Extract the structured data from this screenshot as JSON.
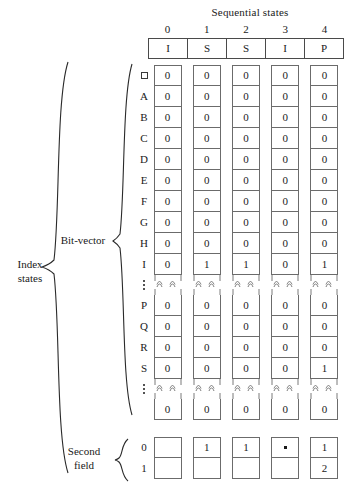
{
  "figure": {
    "header": {
      "title": "Sequential states",
      "column_numbers": [
        "0",
        "1",
        "2",
        "3",
        "4"
      ],
      "state_values": [
        "I",
        "S",
        "S",
        "I",
        "P"
      ]
    },
    "braces": {
      "index_states": "Index\nstates",
      "index_states_line1": "Index",
      "index_states_line2": "states",
      "bit_vector": "Bit-vector",
      "second_field_line1": "Second",
      "second_field_line2": "field"
    },
    "bit_vector": {
      "rows": [
        {
          "label": "blank-square",
          "label_kind": "glyph",
          "values": [
            "0",
            "0",
            "0",
            "0",
            "0"
          ]
        },
        {
          "label": "A",
          "label_kind": "text",
          "values": [
            "0",
            "0",
            "0",
            "0",
            "0"
          ]
        },
        {
          "label": "B",
          "label_kind": "text",
          "values": [
            "0",
            "0",
            "0",
            "0",
            "0"
          ]
        },
        {
          "label": "C",
          "label_kind": "text",
          "values": [
            "0",
            "0",
            "0",
            "0",
            "0"
          ]
        },
        {
          "label": "D",
          "label_kind": "text",
          "values": [
            "0",
            "0",
            "0",
            "0",
            "0"
          ]
        },
        {
          "label": "E",
          "label_kind": "text",
          "values": [
            "0",
            "0",
            "0",
            "0",
            "0"
          ]
        },
        {
          "label": "F",
          "label_kind": "text",
          "values": [
            "0",
            "0",
            "0",
            "0",
            "0"
          ]
        },
        {
          "label": "G",
          "label_kind": "text",
          "values": [
            "0",
            "0",
            "0",
            "0",
            "0"
          ]
        },
        {
          "label": "H",
          "label_kind": "text",
          "values": [
            "0",
            "0",
            "0",
            "0",
            "0"
          ]
        },
        {
          "label": "I",
          "label_kind": "text",
          "values": [
            "0",
            "1",
            "1",
            "0",
            "1"
          ]
        },
        {
          "label": "vertical-ellipsis",
          "label_kind": "ellipsis",
          "values": [
            "",
            "",
            "",
            "",
            ""
          ]
        },
        {
          "label": "P",
          "label_kind": "text",
          "values": [
            "0",
            "0",
            "0",
            "0",
            "0"
          ]
        },
        {
          "label": "Q",
          "label_kind": "text",
          "values": [
            "0",
            "0",
            "0",
            "0",
            "0"
          ]
        },
        {
          "label": "R",
          "label_kind": "text",
          "values": [
            "0",
            "0",
            "0",
            "0",
            "0"
          ]
        },
        {
          "label": "S",
          "label_kind": "text",
          "values": [
            "0",
            "0",
            "0",
            "0",
            "1"
          ]
        },
        {
          "label": "vertical-ellipsis",
          "label_kind": "ellipsis",
          "values": [
            "",
            "",
            "",
            "",
            ""
          ]
        },
        {
          "label": "",
          "label_kind": "text",
          "values": [
            "0",
            "0",
            "0",
            "0",
            "0"
          ]
        }
      ]
    },
    "second_field": {
      "rows": [
        {
          "label": "0",
          "values": [
            "",
            "1",
            "1",
            "dot",
            "1"
          ]
        },
        {
          "label": "1",
          "values": [
            "",
            "",
            "",
            "",
            "2"
          ]
        }
      ]
    },
    "colors": {
      "ink": "#1a1a1a",
      "cell_border": "#6b6b6b",
      "table_border": "#4a4a4a",
      "background": "#ffffff"
    }
  }
}
